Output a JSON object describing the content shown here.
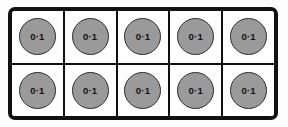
{
  "figure": {
    "type": "ten-frame",
    "rows": 2,
    "columns": 5,
    "total_cells": 10,
    "filled_cells": 10
  },
  "colors": {
    "background": "#fdfdfd",
    "frame_border": "#111111",
    "cell_background": "#ffffff",
    "counter_fill": "#9a9a9a",
    "counter_outline": "#2e2e2e",
    "counter_text": "#111111"
  },
  "grid": {
    "rows": [
      {
        "name": "row-top",
        "cells": [
          {
            "counter_label": "0·1"
          },
          {
            "counter_label": "0·1"
          },
          {
            "counter_label": "0·1"
          },
          {
            "counter_label": "0·1"
          },
          {
            "counter_label": "0·1"
          }
        ]
      },
      {
        "name": "row-bottom",
        "cells": [
          {
            "counter_label": "0·1"
          },
          {
            "counter_label": "0·1"
          },
          {
            "counter_label": "0·1"
          },
          {
            "counter_label": "0·1"
          },
          {
            "counter_label": "0·1"
          }
        ]
      }
    ]
  }
}
